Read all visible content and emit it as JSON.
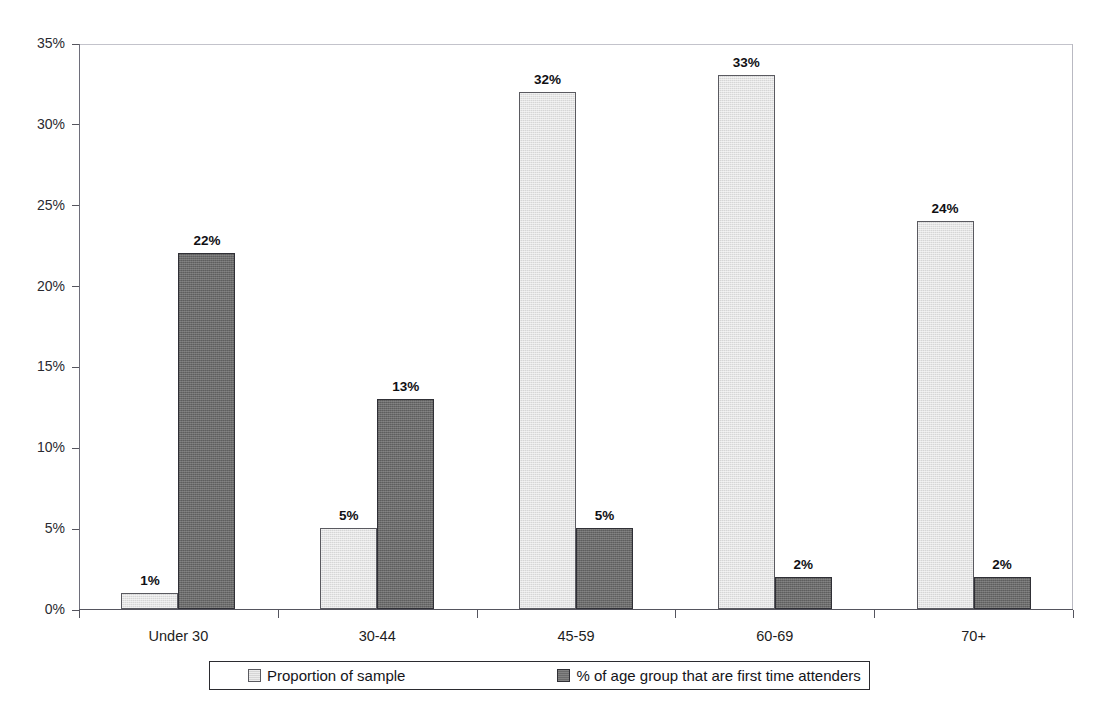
{
  "chart_data": {
    "type": "bar",
    "title": "",
    "subtitle": "",
    "xlabel": "",
    "ylabel": "",
    "categories": [
      "Under 30",
      "30-44",
      "45-59",
      "60-69",
      "70+"
    ],
    "series": [
      {
        "name": "Proportion of sample",
        "color": "#d6d6d6",
        "values": [
          1,
          5,
          32,
          33,
          24
        ],
        "labels": [
          "1%",
          "5%",
          "32%",
          "33%",
          "24%"
        ]
      },
      {
        "name": "% of age group that are first time attenders",
        "color": "#6b6b6b",
        "values": [
          22,
          13,
          5,
          2,
          2
        ],
        "labels": [
          "22%",
          "13%",
          "5%",
          "2%",
          "2%"
        ]
      }
    ],
    "ylim": [
      0,
      35
    ],
    "ytick_values": [
      0,
      5,
      10,
      15,
      20,
      25,
      30,
      35
    ],
    "ytick_labels": [
      "0%",
      "5%",
      "10%",
      "15%",
      "20%",
      "25%",
      "30%",
      "35%"
    ],
    "grid": "top-line-only",
    "legend_position": "bottom",
    "value_labels_shown": true
  },
  "legend": {
    "entries": [
      {
        "label": "Proportion of sample",
        "swatch": "light-grey-swatch"
      },
      {
        "label": "% of age group that are first time attenders",
        "swatch": "dark-grey-swatch"
      }
    ]
  }
}
